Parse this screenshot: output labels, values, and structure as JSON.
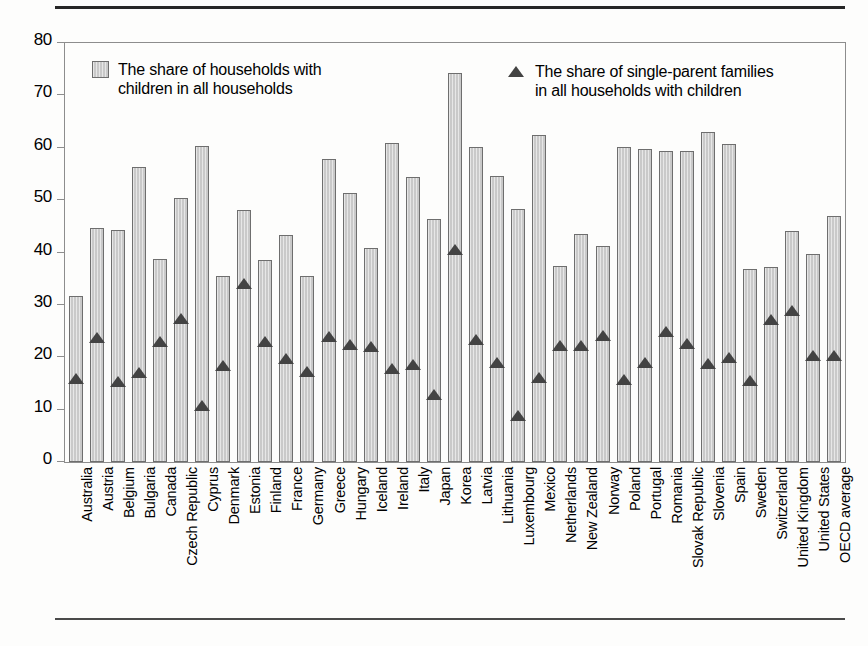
{
  "chart_data": {
    "type": "bar",
    "title": "",
    "xlabel": "",
    "ylabel": "",
    "ylim": [
      0,
      80
    ],
    "yticks": [
      0,
      10,
      20,
      30,
      40,
      50,
      60,
      70,
      80
    ],
    "grid": false,
    "legend_position": "inside-top",
    "categories": [
      "Australia",
      "Austria",
      "Belgium",
      "Bulgaria",
      "Canada",
      "Czech Republic",
      "Cyprus",
      "Denmark",
      "Estonia",
      "Finland",
      "France",
      "Germany",
      "Greece",
      "Hungary",
      "Iceland",
      "Ireland",
      "Italy",
      "Japan",
      "Korea",
      "Latvia",
      "Lithuania",
      "Luxembourg",
      "Mexico",
      "Netherlands",
      "New Zealand",
      "Norway",
      "Poland",
      "Portugal",
      "Romania",
      "Slovak Republic",
      "Slovenia",
      "Spain",
      "Sweden",
      "Switzerland",
      "United Kingdom",
      "United States",
      "OECD average"
    ],
    "series": [
      {
        "name": "The share of households with children in all households",
        "type": "bar",
        "values": [
          31.7,
          44.7,
          44.3,
          56.3,
          38.8,
          50.5,
          60.4,
          35.6,
          48.2,
          38.5,
          43.4,
          35.6,
          57.8,
          51.4,
          40.8,
          61.0,
          54.5,
          46.4,
          74.3,
          60.1,
          54.7,
          48.3,
          62.4,
          37.4,
          43.5,
          41.3,
          60.2,
          59.7,
          59.4,
          59.3,
          63.1,
          60.8,
          36.8,
          37.3,
          44.1,
          39.7,
          47.0
        ]
      },
      {
        "name": "The share of single-parent families in all households with children",
        "type": "scatter",
        "marker": "triangle",
        "values": [
          15.8,
          23.6,
          15.3,
          17.0,
          22.9,
          27.3,
          10.6,
          18.4,
          34.0,
          23.0,
          19.6,
          17.2,
          23.8,
          22.4,
          22.0,
          17.7,
          18.5,
          12.7,
          40.4,
          23.3,
          18.9,
          8.7,
          16.1,
          22.2,
          22.1,
          24.0,
          15.7,
          18.9,
          24.8,
          22.6,
          18.8,
          19.8,
          15.4,
          27.2,
          28.8,
          20.3,
          20.3
        ]
      }
    ]
  },
  "legend": {
    "bars_label": "The share of households with\nchildren in all households",
    "triangle_label": "The share of single-parent families\nin all households with children",
    "bar_swatch_icon": "bar-swatch-icon",
    "triangle_swatch_icon": "triangle-marker-icon"
  },
  "colors": {
    "bar_fill": "#c9c9c9",
    "bar_stroke": "#6e6e6e",
    "marker": "#434343",
    "axis": "#8d8d8d",
    "text": "#000000",
    "page_background": "#fdfdfc"
  }
}
